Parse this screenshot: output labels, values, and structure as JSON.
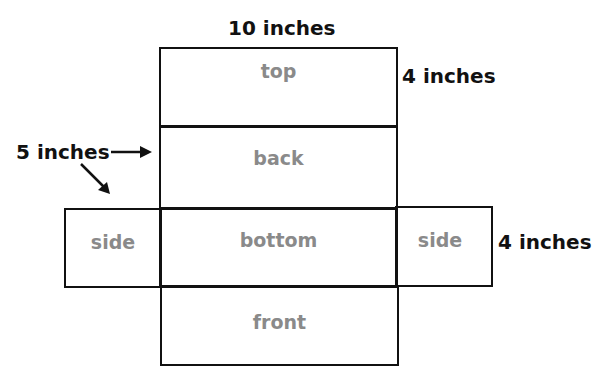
{
  "diagram": {
    "faces": [
      {
        "id": "top",
        "label": "top"
      },
      {
        "id": "back",
        "label": "back"
      },
      {
        "id": "bottom",
        "label": "bottom"
      },
      {
        "id": "side-left",
        "label": "side"
      },
      {
        "id": "side-right",
        "label": "side"
      },
      {
        "id": "front",
        "label": "front"
      }
    ],
    "dimensions": {
      "length": "10 inches",
      "height_top": "4 inches",
      "width": "5 inches",
      "height_side": "4 inches"
    },
    "colors": {
      "outline": "#111111",
      "face_label": "#8a8a8a",
      "dimension_label": "#111111",
      "background": "#ffffff"
    }
  }
}
